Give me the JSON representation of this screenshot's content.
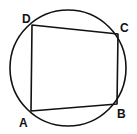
{
  "diagram": {
    "type": "cyclic-quadrilateral-inscribed-in-circle",
    "circle": {
      "cx": 68,
      "cy": 68,
      "r": 58
    },
    "vertices": [
      {
        "label": "A",
        "x": 31,
        "y": 111,
        "label_x": 19,
        "label_y": 127
      },
      {
        "label": "B",
        "x": 117,
        "y": 104,
        "label_x": 117,
        "label_y": 118
      },
      {
        "label": "C",
        "x": 118,
        "y": 34,
        "label_x": 120,
        "label_y": 32
      },
      {
        "label": "D",
        "x": 32,
        "y": 25,
        "label_x": 22,
        "label_y": 23
      }
    ],
    "stroke_color": "#111111"
  }
}
